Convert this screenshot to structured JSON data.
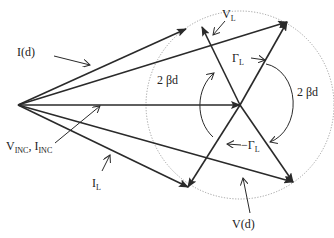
{
  "diagram": {
    "colors": {
      "line": "#2a2a2a",
      "circle": "#8a8a8a",
      "background": "#ffffff"
    },
    "labels": {
      "i_d": "I(d)",
      "v_l": "V",
      "v_l_sub": "L",
      "gamma_l": "Γ",
      "gamma_l_sub": "L",
      "two_beta_d_left": "2 βd",
      "two_beta_d_right": "2 βd",
      "v_inc": "V",
      "v_inc_sub": "INC",
      "i_inc_sep": ", I",
      "i_inc_sub": "INC",
      "neg_gamma_l": "−Γ",
      "neg_gamma_l_sub": "L",
      "i_l": "I",
      "i_l_sub": "L",
      "v_d": "V(d)"
    }
  }
}
